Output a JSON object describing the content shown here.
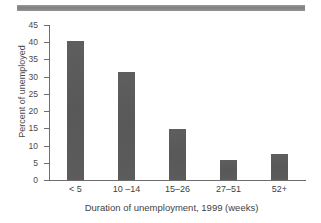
{
  "figure": {
    "top_rule_color": "#8a8a8a",
    "bar_color": "#5c5c5c",
    "axis_color": "#6d6d6d"
  },
  "chart_data": {
    "type": "bar",
    "title": "",
    "subtitle": "",
    "xlabel": "Duration of unemployment, 1999 (weeks)",
    "ylabel": "Percent of unemployed",
    "categories": [
      "< 5",
      "10 –14",
      "15–26",
      "27–51",
      "52+"
    ],
    "values": [
      40.5,
      31.4,
      14.7,
      5.9,
      7.5
    ],
    "ylim": [
      0,
      45
    ],
    "ytick_labels": [
      "0",
      "5",
      "10",
      "15",
      "20",
      "25",
      "30",
      "35",
      "40",
      "45"
    ],
    "ytick_values": [
      0,
      5,
      10,
      15,
      20,
      25,
      30,
      35,
      40,
      45
    ],
    "ytick_step": 5,
    "grid": false,
    "legend": null,
    "legend_position": "none",
    "annotations": []
  }
}
